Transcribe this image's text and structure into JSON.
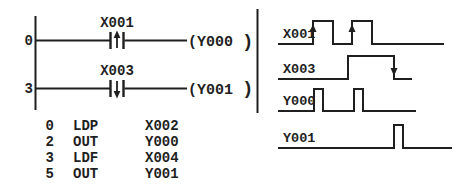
{
  "colors": {
    "background": "#ffffff",
    "ink": "#1f1f1f"
  },
  "ladder": {
    "rungs": [
      {
        "step": "0",
        "contact_label": "X001",
        "contact_type": "rising-edge-pulse-contact",
        "coil_label": "(Y000",
        "coil_close": ")"
      },
      {
        "step": "3",
        "contact_label": "X003",
        "contact_type": "falling-edge-pulse-contact",
        "coil_label": "(Y001",
        "coil_close": ")"
      }
    ]
  },
  "instruction_list": {
    "rows": [
      {
        "step": "0",
        "mnemonic": "LDP",
        "operand": "X002"
      },
      {
        "step": "2",
        "mnemonic": "OUT",
        "operand": "Y000"
      },
      {
        "step": "3",
        "mnemonic": "LDF",
        "operand": "X004"
      },
      {
        "step": "5",
        "mnemonic": "OUT",
        "operand": "Y001"
      }
    ]
  },
  "timing": {
    "signals": [
      {
        "name": "X001",
        "base_y": 44,
        "high_y": 21,
        "x_start": 278,
        "x_end": 444,
        "pulses": [
          [
            313,
            333
          ],
          [
            352,
            372
          ]
        ],
        "arrows": [
          {
            "x": 313,
            "dir": "up"
          },
          {
            "x": 352,
            "dir": "up"
          }
        ]
      },
      {
        "name": "X003",
        "base_y": 79,
        "high_y": 56,
        "x_start": 278,
        "x_end": 412,
        "pulses": [
          [
            348,
            394
          ]
        ],
        "arrows": [
          {
            "x": 394,
            "dir": "down"
          }
        ]
      },
      {
        "name": "Y000",
        "base_y": 111,
        "high_y": 89,
        "x_start": 278,
        "x_end": 416,
        "pulses": [
          [
            314,
            323
          ],
          [
            354,
            363
          ]
        ],
        "arrows": []
      },
      {
        "name": "Y001",
        "base_y": 148,
        "high_y": 125,
        "x_start": 278,
        "x_end": 452,
        "pulses": [
          [
            394,
            403
          ]
        ],
        "arrows": []
      }
    ]
  }
}
